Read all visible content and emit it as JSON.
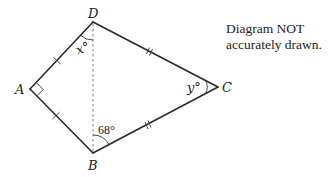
{
  "diagram": {
    "vertices": {
      "A": {
        "label": "A",
        "x": 30,
        "y": 89
      },
      "B": {
        "label": "B",
        "x": 93,
        "y": 153
      },
      "C": {
        "label": "C",
        "x": 218,
        "y": 87
      },
      "D": {
        "label": "D",
        "x": 93,
        "y": 22
      }
    },
    "angles": {
      "x": {
        "label": "x°",
        "at": "D"
      },
      "y": {
        "label": "y°",
        "at": "C"
      },
      "b": {
        "label": "68°",
        "at": "B"
      }
    },
    "right_angle_at": "A",
    "equal_sides": {
      "single_tick": [
        "AD",
        "AB"
      ],
      "double_tick": [
        "DC",
        "BC"
      ]
    },
    "dashed_segment": "DB",
    "note": {
      "line1": "Diagram NOT",
      "line2": "accurately drawn."
    }
  }
}
